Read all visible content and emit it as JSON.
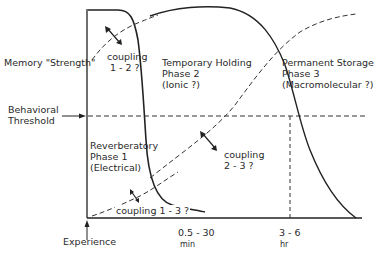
{
  "diagram": {
    "type": "memory-consolidation-phases",
    "y_axis_label": "Memory \"Strength\"",
    "threshold_label_line1": "Behavioral",
    "threshold_label_line2": "Threshold",
    "x_origin_label": "Experience",
    "x_ticks": [
      {
        "value": "0.5 - 30",
        "unit": "min"
      },
      {
        "value": "3 - 6",
        "unit": "hr"
      }
    ],
    "phases": [
      {
        "line1": "Reverberatory",
        "line2": "Phase 1",
        "line3": "(Electrical)"
      },
      {
        "line1": "Temporary Holding",
        "line2": "Phase 2",
        "line3": "(Ionic ?)"
      },
      {
        "line1": "Permanent Storage",
        "line2": "Phase 3",
        "line3": "(Macromolecular ?)"
      }
    ],
    "couplings": [
      {
        "line1": "coupling",
        "line2": "1 - 2 ?"
      },
      {
        "line1": "coupling",
        "line2": "2 - 3 ?"
      },
      {
        "line1": "coupling 1 - 3 ?"
      }
    ],
    "colors": {
      "line": "#222222",
      "background": "#ffffff"
    }
  }
}
